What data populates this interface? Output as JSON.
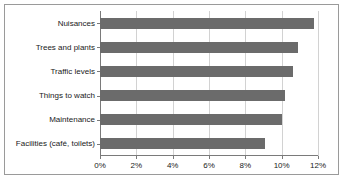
{
  "chart_data": {
    "type": "bar",
    "orientation": "horizontal",
    "title": "",
    "xlabel": "",
    "ylabel": "",
    "categories": [
      "Nuisances",
      "Trees and plants",
      "Traffic levels",
      "Things to watch",
      "Maintenance",
      "Facilities (café, toilets)"
    ],
    "values": [
      11.8,
      10.9,
      10.6,
      10.2,
      10.0,
      9.1
    ],
    "xlim": [
      0,
      12
    ],
    "xticks": [
      0,
      2,
      4,
      6,
      8,
      10,
      12
    ],
    "xtick_labels": [
      "0%",
      "2%",
      "4%",
      "6%",
      "8%",
      "10%",
      "12%"
    ],
    "grid": true,
    "grid_axis": "x",
    "legend": false,
    "bar_color": "#6b6b6b",
    "axis_color": "#7a7a7a",
    "gridline_color": "#d2d2d2",
    "frame_border_color": "#9a9a9a",
    "background_color": "#ffffff"
  }
}
